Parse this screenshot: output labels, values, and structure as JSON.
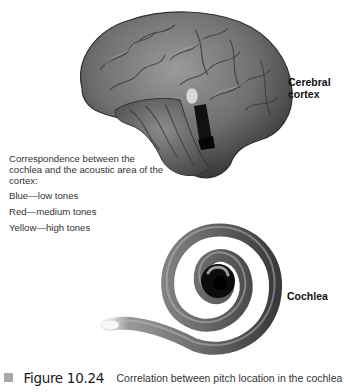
{
  "figure": {
    "labels": {
      "cerebral_cortex": [
        "Cerebral",
        "cortex"
      ],
      "cochlea": "Cochlea"
    },
    "legend": {
      "intro": "Correspondence between the cochlea and the acoustic area of the cortex:",
      "items": [
        {
          "label": "Blue—low tones",
          "color": "#0000ff"
        },
        {
          "label": "Red—medium tones",
          "color": "#ff0000"
        },
        {
          "label": "Yellow—high tones",
          "color": "#ffff00"
        }
      ]
    },
    "caption": {
      "number": "Figure 10.24",
      "text": "Correlation between pitch location in the cochlea"
    }
  }
}
